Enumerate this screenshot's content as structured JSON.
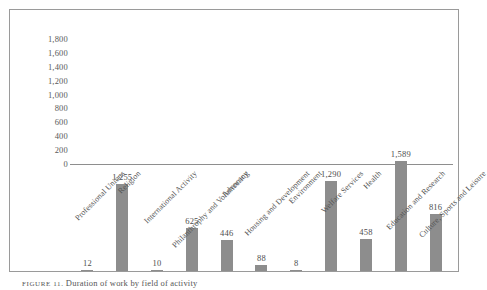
{
  "figure": {
    "caption_label": "FIGURE 11.",
    "caption_text": "Duration of work by field of activity"
  },
  "chart_data": {
    "type": "bar",
    "title": "",
    "xlabel": "",
    "ylabel": "",
    "ylim": [
      0,
      1800
    ],
    "grid": false,
    "legend": "none",
    "bar_color": "#8d8d8d",
    "categories": [
      "Professional Unions",
      "Religion",
      "International Activity",
      "Philanthrophy and Volunteering",
      "Advocacy",
      "Housing and Development",
      "Environment",
      "Welfare Services",
      "Health",
      "Education and Research",
      "Culture, Sports and Leisure"
    ],
    "values": [
      12,
      1255,
      10,
      625,
      446,
      88,
      8,
      1290,
      458,
      1589,
      816
    ],
    "value_labels": [
      "12",
      "1,255",
      "10",
      "625",
      "446",
      "88",
      "8",
      "1,290",
      "458",
      "1,589",
      "816"
    ],
    "y_ticks": [
      0,
      200,
      400,
      600,
      800,
      1000,
      1200,
      1400,
      1600,
      1800
    ],
    "y_tick_labels": [
      "0",
      "200",
      "400",
      "600",
      "800",
      "1,000",
      "1,200",
      "1,400",
      "1,600",
      "1,800"
    ]
  }
}
